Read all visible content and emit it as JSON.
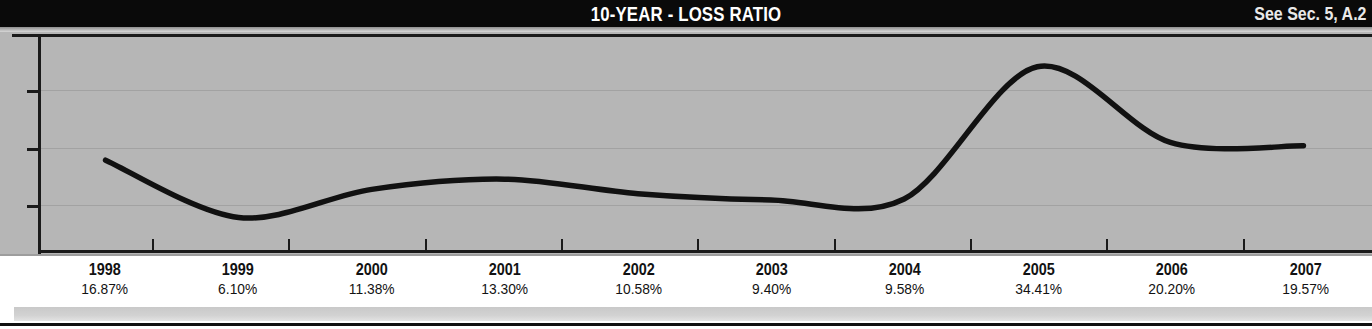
{
  "header": {
    "title": "10-YEAR - LOSS RATIO",
    "reference_note": "See Sec. 5, A.2",
    "background_color": "#0a0a0a",
    "text_color": "#ffffff"
  },
  "plot": {
    "background_color": "#b6b6b6",
    "line_color": "#111111",
    "gridline_color": "#a2a2a2",
    "frame_color": "#1a1a1a"
  },
  "chart_data": {
    "type": "line",
    "title": "10-YEAR - LOSS RATIO",
    "subtitle": "See Sec. 5, A.2",
    "xlabel": "",
    "ylabel": "",
    "categories": [
      "1998",
      "1999",
      "2000",
      "2001",
      "2002",
      "2003",
      "2004",
      "2005",
      "2006",
      "2007"
    ],
    "values": [
      16.87,
      6.1,
      11.38,
      13.3,
      10.58,
      9.4,
      9.58,
      34.41,
      20.2,
      19.57
    ],
    "value_labels": [
      "16.87%",
      "6.10%",
      "11.38%",
      "13.30%",
      "10.58%",
      "9.40%",
      "9.58%",
      "34.41%",
      "20.20%",
      "19.57%"
    ],
    "ylim": [
      0,
      40
    ],
    "yticks": [
      10,
      20,
      30
    ],
    "grid": true,
    "gridline_axis": "y",
    "legend": false,
    "legend_position": "none",
    "series": [
      {
        "name": "Loss Ratio",
        "values": [
          16.87,
          6.1,
          11.38,
          13.3,
          10.58,
          9.4,
          9.58,
          34.41,
          20.2,
          19.57
        ]
      }
    ],
    "smoothing": "spline"
  },
  "axis_labels": [
    {
      "year": "1998",
      "value": "16.87%"
    },
    {
      "year": "1999",
      "value": "6.10%"
    },
    {
      "year": "2000",
      "value": "11.38%"
    },
    {
      "year": "2001",
      "value": "13.30%"
    },
    {
      "year": "2002",
      "value": "10.58%"
    },
    {
      "year": "2003",
      "value": "9.40%"
    },
    {
      "year": "2004",
      "value": "9.58%"
    },
    {
      "year": "2005",
      "value": "34.41%"
    },
    {
      "year": "2006",
      "value": "20.20%"
    },
    {
      "year": "2007",
      "value": "19.57%"
    }
  ]
}
